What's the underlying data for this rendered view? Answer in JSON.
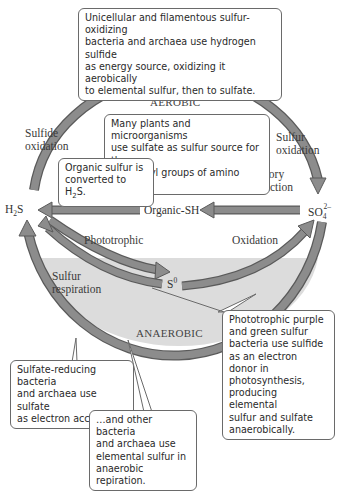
{
  "colors": {
    "zone_fill": "#dcdcdc",
    "arrow_fill": "#8c8c8c",
    "arrow_stroke": "#5a5a5a",
    "callout_border": "#6a6a6a",
    "text": "#333333"
  },
  "zones": {
    "aerobic": "AEROBIC",
    "anaerobic": "ANAEROBIC"
  },
  "compounds": {
    "h2s": {
      "base": "H",
      "sub": "2",
      "tail": "S"
    },
    "s0_top": {
      "base": "S",
      "sup": "0"
    },
    "s0_mid": {
      "base": "S",
      "sup": "0"
    },
    "organic_sh": "Organic-SH",
    "so4": {
      "base": "SO",
      "sub": "4",
      "sup": "2–"
    }
  },
  "process_labels": {
    "sulfide_oxidation": [
      "Sulfide",
      "oxidation"
    ],
    "sulfur_oxidation": [
      "Sulfur",
      "oxidation"
    ],
    "desulfuration": "Desulfuration",
    "assimilatory": [
      "Assimilatory",
      "sulfate reduction"
    ],
    "phototrophic": "Phototrophic",
    "oxidation": "Oxidation",
    "sulfur_respiration": [
      "Sulfur",
      "respiration"
    ]
  },
  "callouts": {
    "top": [
      "Unicellular and filamentous sulfur-oxidizing",
      "bacteria and archaea use hydrogen sulfide",
      "as energy source, oxidizing it aerobically",
      "to elemental sulfur, then to sulfate."
    ],
    "plants": [
      "Many plants and microorganisms",
      "use sulfate as sulfur source for the",
      "sulfhydryl groups of amino acids."
    ],
    "organic": {
      "line1": "Organic sulfur is",
      "line2_pre": "converted to H",
      "line2_sub": "2",
      "line2_post": "S."
    },
    "phototrophic": [
      "Phototrophic purple",
      "and green sulfur",
      "bacteria use sulfide",
      "as an electron donor in",
      "photosynthesis,",
      "producing elemental",
      "sulfur and sulfate",
      "anaerobically."
    ],
    "sulfate_reducing": [
      "Sulfate-reducing bacteria",
      "and archaea use sulfate",
      "as electron acceptor…"
    ],
    "other_bacteria": [
      "…and other bacteria",
      "and archaea use",
      "elemental sulfur in",
      "anaerobic repiration."
    ]
  }
}
